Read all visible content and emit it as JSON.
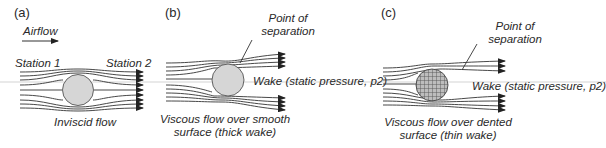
{
  "panels": [
    {
      "id": "a",
      "letter": "(a)",
      "airflow_label": "Airflow",
      "station1": "Station 1",
      "station2": "Station 2",
      "caption": "Inviscid flow"
    },
    {
      "id": "b",
      "letter": "(b)",
      "separation_label_1": "Point of",
      "separation_label_2": "separation",
      "wake_label": "Wake (static pressure, p2)",
      "caption_1": "Viscous flow over smooth",
      "caption_2": "surface (thick wake)"
    },
    {
      "id": "c",
      "letter": "(c)",
      "separation_label_1": "Point of",
      "separation_label_2": "separation",
      "wake_label": "Wake (static pressure, p2)",
      "caption_1": "Viscous flow over dented",
      "caption_2": "surface (thin wake)"
    }
  ],
  "colors": {
    "line": "#333333",
    "sphere_fill": "#d6d6d6",
    "guide": "#bbbbbb"
  }
}
